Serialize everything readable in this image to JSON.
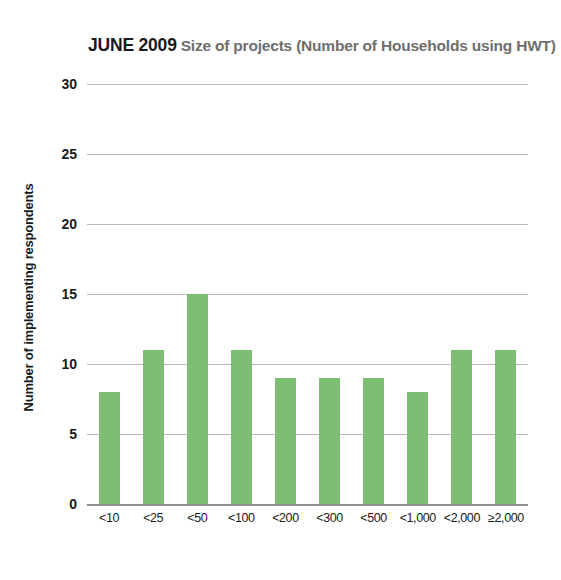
{
  "chart_data": {
    "type": "bar",
    "title_strong": "JUNE 2009",
    "title_rest": "Size of projects (Number of Households using HWT)",
    "xlabel": "",
    "ylabel": "Number of implementing respondents",
    "categories": [
      "<10",
      "<25",
      "<50",
      "<100",
      "<200",
      "<300",
      "<500",
      "<1,000",
      "<2,000",
      "≥2,000"
    ],
    "values": [
      8,
      11,
      15,
      11,
      9,
      9,
      9,
      8,
      11,
      11
    ],
    "ylim": [
      0,
      30
    ],
    "yticks": [
      0,
      5,
      10,
      15,
      20,
      25,
      30
    ],
    "ytick_labels": [
      "0",
      "5",
      "10",
      "15",
      "20",
      "25",
      "30"
    ],
    "grid": true,
    "legend": "none",
    "bar_color": "#7cbf73",
    "gridline_color": "#b9b9b9",
    "axis_color": "#8d8d8d",
    "background_color": "#ffffff",
    "title_color_strong": "#1a1a1a",
    "title_color_rest": "#6e6e6e"
  }
}
